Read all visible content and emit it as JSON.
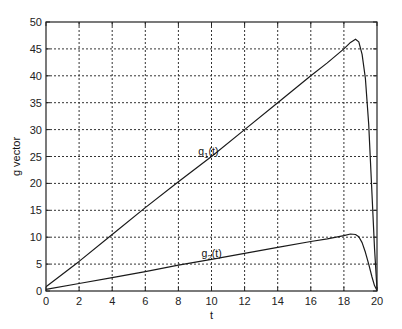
{
  "chart_data": {
    "type": "line",
    "title": "",
    "xlabel": "t",
    "ylabel": "g vector",
    "xlim": [
      0,
      20
    ],
    "ylim": [
      0,
      50
    ],
    "xticks": [
      0,
      2,
      4,
      6,
      8,
      10,
      12,
      14,
      16,
      18,
      20
    ],
    "yticks": [
      0,
      5,
      10,
      15,
      20,
      25,
      30,
      35,
      40,
      45,
      50
    ],
    "grid": true,
    "legend": null,
    "annotations": [
      {
        "text": "g1(t)",
        "base": "g",
        "sub": "1",
        "suffix": "(t)",
        "x": 9.2,
        "y": 25.3
      },
      {
        "text": "g2(t)",
        "base": "g",
        "sub": "2",
        "suffix": "(t)",
        "x": 9.4,
        "y": 6.3
      }
    ],
    "series": [
      {
        "name": "g1(t)",
        "x": [
          0,
          2,
          4,
          6,
          8,
          10,
          12,
          14,
          16,
          17,
          18,
          18.4,
          18.7,
          18.9,
          19.1,
          19.3,
          19.5,
          19.7,
          19.85,
          20
        ],
        "y": [
          0.8,
          5.5,
          10.5,
          15.5,
          20.3,
          25.0,
          30.0,
          35.0,
          40.0,
          42.4,
          45.0,
          46.2,
          46.8,
          46.3,
          44.0,
          39.5,
          31.0,
          18.0,
          8.0,
          0.3
        ]
      },
      {
        "name": "g2(t)",
        "x": [
          0,
          2,
          4,
          6,
          8,
          10,
          12,
          14,
          16,
          17,
          18,
          18.4,
          18.7,
          18.9,
          19.1,
          19.3,
          19.5,
          19.7,
          19.85,
          20
        ],
        "y": [
          0.3,
          1.4,
          2.5,
          3.6,
          4.8,
          5.9,
          7.0,
          8.1,
          9.2,
          9.7,
          10.3,
          10.6,
          10.5,
          10.1,
          9.0,
          7.2,
          5.0,
          2.6,
          1.0,
          0.1
        ]
      }
    ]
  }
}
